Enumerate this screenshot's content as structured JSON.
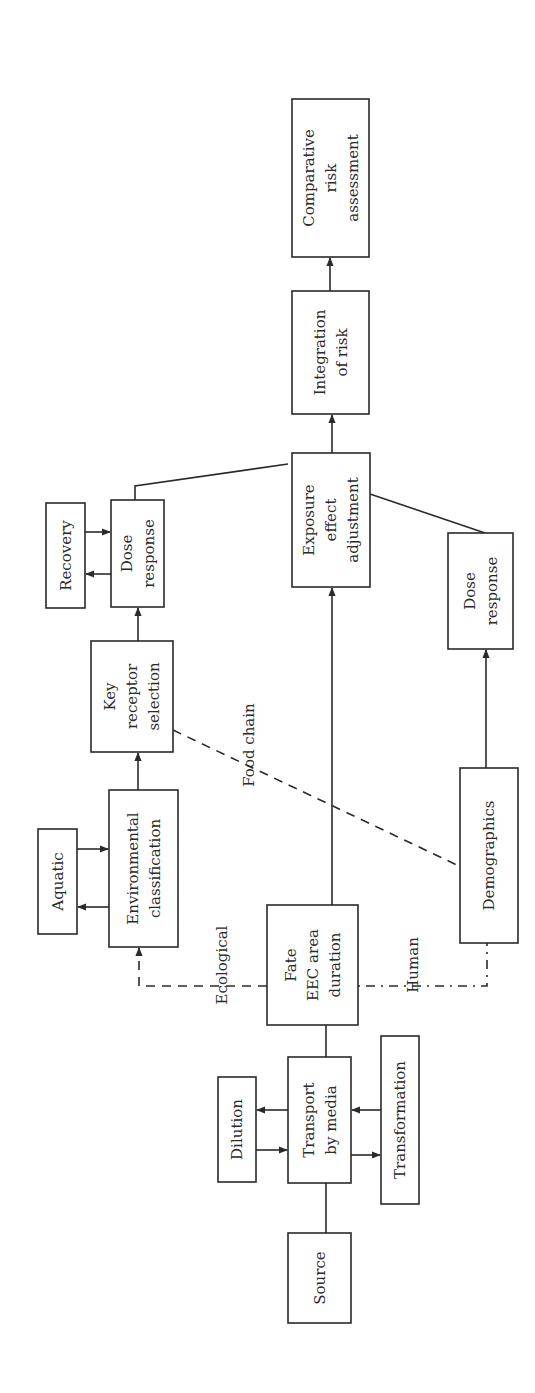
{
  "diagram": {
    "orientation": "rotated -90deg (flow reads bottom-to-top)",
    "nodes": [
      {
        "id": "source",
        "lines": [
          "Source"
        ],
        "x": 288,
        "y": 1233,
        "w": 63,
        "h": 90
      },
      {
        "id": "transport",
        "lines": [
          "Transport",
          "by media"
        ],
        "x": 288,
        "y": 1057,
        "w": 63,
        "h": 126
      },
      {
        "id": "dilution",
        "lines": [
          "Dilution"
        ],
        "x": 218,
        "y": 1077,
        "w": 38,
        "h": 105
      },
      {
        "id": "transformation",
        "lines": [
          "Transformation"
        ],
        "x": 381,
        "y": 1036,
        "w": 38,
        "h": 168
      },
      {
        "id": "fate",
        "lines": [
          "Fate",
          "EEC area",
          "duration"
        ],
        "x": 267,
        "y": 905,
        "w": 91,
        "h": 120
      },
      {
        "id": "env-class",
        "lines": [
          "Environmental",
          "classification"
        ],
        "x": 109,
        "y": 790,
        "w": 69,
        "h": 157
      },
      {
        "id": "aquatic",
        "lines": [
          "Aquatic"
        ],
        "x": 38,
        "y": 829,
        "w": 39,
        "h": 105
      },
      {
        "id": "key-receptor",
        "lines": [
          "Key",
          "receptor",
          "selection"
        ],
        "x": 91,
        "y": 641,
        "w": 82,
        "h": 111
      },
      {
        "id": "dose-response-eco",
        "lines": [
          "Dose",
          "response"
        ],
        "x": 111,
        "y": 500,
        "w": 53,
        "h": 107
      },
      {
        "id": "recovery",
        "lines": [
          "Recovery"
        ],
        "x": 46,
        "y": 503,
        "w": 39,
        "h": 105
      },
      {
        "id": "exposure-effect",
        "lines": [
          "Exposure",
          "effect",
          "adjustment"
        ],
        "x": 292,
        "y": 453,
        "w": 78,
        "h": 134
      },
      {
        "id": "integration",
        "lines": [
          "Integration",
          "of risk"
        ],
        "x": 292,
        "y": 291,
        "w": 77,
        "h": 123
      },
      {
        "id": "comparative",
        "lines": [
          "Comparative",
          "risk",
          "assessment"
        ],
        "x": 292,
        "y": 99,
        "w": 77,
        "h": 158
      },
      {
        "id": "dose-response-human",
        "lines": [
          "Dose",
          "response"
        ],
        "x": 448,
        "y": 533,
        "w": 65,
        "h": 116
      },
      {
        "id": "demographics",
        "lines": [
          "Demographics"
        ],
        "x": 460,
        "y": 768,
        "w": 58,
        "h": 175
      }
    ],
    "edge_labels": [
      {
        "id": "ecological",
        "text": "Ecological",
        "x": 222,
        "y": 965
      },
      {
        "id": "human",
        "text": "Human",
        "x": 413,
        "y": 965
      },
      {
        "id": "food-chain",
        "text": "Food chain",
        "x": 249,
        "y": 745
      }
    ],
    "edges": [
      {
        "from": "source",
        "to": "transport",
        "style": "solid",
        "arrow": false
      },
      {
        "from": "transport",
        "to": "dilution",
        "style": "solid",
        "arrow": true
      },
      {
        "from": "dilution",
        "to": "transport",
        "style": "solid",
        "arrow": true
      },
      {
        "from": "transport",
        "to": "transformation",
        "style": "solid",
        "arrow": true
      },
      {
        "from": "transformation",
        "to": "transport",
        "style": "solid",
        "arrow": true
      },
      {
        "from": "transport",
        "to": "fate",
        "style": "solid",
        "arrow": false
      },
      {
        "from": "fate",
        "to": "exposure-effect",
        "style": "solid",
        "arrow": true
      },
      {
        "from": "fate",
        "to": "env-class",
        "style": "dashed",
        "arrow": true,
        "label": "Ecological"
      },
      {
        "from": "fate",
        "to": "demographics",
        "style": "dash-dot",
        "arrow": false,
        "label": "Human"
      },
      {
        "from": "env-class",
        "to": "aquatic",
        "style": "solid",
        "arrow": true
      },
      {
        "from": "aquatic",
        "to": "env-class",
        "style": "solid",
        "arrow": true
      },
      {
        "from": "env-class",
        "to": "key-receptor",
        "style": "solid",
        "arrow": true
      },
      {
        "from": "key-receptor",
        "to": "demographics",
        "style": "dashed",
        "arrow": false,
        "label": "Food chain"
      },
      {
        "from": "key-receptor",
        "to": "dose-response-eco",
        "style": "solid",
        "arrow": true
      },
      {
        "from": "dose-response-eco",
        "to": "recovery",
        "style": "solid",
        "arrow": true
      },
      {
        "from": "recovery",
        "to": "dose-response-eco",
        "style": "solid",
        "arrow": true
      },
      {
        "from": "dose-response-eco",
        "to": "exposure-effect",
        "style": "solid",
        "arrow": false
      },
      {
        "from": "demographics",
        "to": "dose-response-human",
        "style": "solid",
        "arrow": true
      },
      {
        "from": "dose-response-human",
        "to": "exposure-effect",
        "style": "solid",
        "arrow": false
      },
      {
        "from": "exposure-effect",
        "to": "integration",
        "style": "solid",
        "arrow": true
      },
      {
        "from": "integration",
        "to": "comparative",
        "style": "solid",
        "arrow": true
      }
    ]
  }
}
